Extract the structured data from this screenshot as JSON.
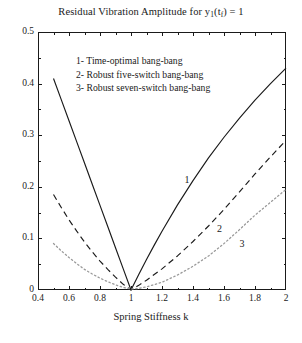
{
  "chart_data": {
    "type": "line",
    "title": "Residual Vibration Amplitude for y1(tf) = 1",
    "title_parts": {
      "lead": "Residual Vibration Amplitude for y",
      "sub1": "1",
      "mid": "(t",
      "sub2": "f",
      "tail": ") = 1"
    },
    "xlabel": "Spring Stiffness k",
    "ylabel": "",
    "xlim": [
      0.4,
      2.0
    ],
    "ylim": [
      0.0,
      0.5
    ],
    "xticks": [
      0.4,
      0.6,
      0.8,
      1.0,
      1.2,
      1.4,
      1.6,
      1.8,
      2.0
    ],
    "xtick_labels": [
      "0.4",
      "0.6",
      "0.8",
      "1",
      "1.2",
      "1.4",
      "1.6",
      "1.8",
      "2"
    ],
    "yticks": [
      0.0,
      0.1,
      0.2,
      0.3,
      0.4,
      0.5
    ],
    "ytick_labels": [
      "0",
      "0.1",
      "0.2",
      "0.3",
      "0.4",
      "0.5"
    ],
    "x_minor_ticks": [
      0.5,
      0.7,
      0.9,
      1.1,
      1.3,
      1.5,
      1.7,
      1.9
    ],
    "y_minor_ticks": [
      0.05,
      0.15,
      0.25,
      0.35,
      0.45
    ],
    "grid": false,
    "legend_position": "inside-top-center",
    "line_color": "#1a1a1a",
    "series": [
      {
        "name": "1- Time-optimal bang-bang",
        "tag": "1",
        "style": "solid",
        "x": [
          0.5,
          0.55,
          0.6,
          0.65,
          0.7,
          0.75,
          0.8,
          0.85,
          0.9,
          0.95,
          1.0,
          1.05,
          1.1,
          1.15,
          1.2,
          1.3,
          1.4,
          1.5,
          1.6,
          1.7,
          1.8,
          1.9,
          2.0
        ],
        "y": [
          0.41,
          0.369,
          0.328,
          0.287,
          0.246,
          0.205,
          0.164,
          0.123,
          0.082,
          0.041,
          0.0,
          0.03,
          0.059,
          0.087,
          0.114,
          0.165,
          0.212,
          0.256,
          0.296,
          0.333,
          0.368,
          0.4,
          0.43
        ]
      },
      {
        "name": "2- Robust five-switch bang-bang",
        "tag": "2",
        "style": "dashed",
        "x": [
          0.5,
          0.55,
          0.6,
          0.65,
          0.7,
          0.75,
          0.8,
          0.85,
          0.9,
          0.95,
          1.0,
          1.05,
          1.1,
          1.2,
          1.3,
          1.4,
          1.5,
          1.6,
          1.7,
          1.8,
          1.9,
          2.0
        ],
        "y": [
          0.185,
          0.16,
          0.136,
          0.114,
          0.093,
          0.074,
          0.056,
          0.04,
          0.025,
          0.011,
          0.0,
          0.009,
          0.019,
          0.041,
          0.066,
          0.094,
          0.124,
          0.156,
          0.19,
          0.225,
          0.258,
          0.29
        ]
      },
      {
        "name": "3- Robust seven-switch bang-bang",
        "tag": "3",
        "style": "dotted",
        "x": [
          0.5,
          0.55,
          0.6,
          0.65,
          0.7,
          0.75,
          0.8,
          0.85,
          0.9,
          0.95,
          1.0,
          1.05,
          1.1,
          1.2,
          1.3,
          1.4,
          1.5,
          1.6,
          1.7,
          1.8,
          1.9,
          2.0
        ],
        "y": [
          0.09,
          0.076,
          0.063,
          0.051,
          0.04,
          0.031,
          0.023,
          0.016,
          0.01,
          0.005,
          0.002,
          0.003,
          0.006,
          0.015,
          0.029,
          0.046,
          0.066,
          0.09,
          0.117,
          0.145,
          0.17,
          0.195
        ]
      }
    ],
    "curve_tags": [
      {
        "text": "1",
        "x": 1.345,
        "y": 0.222
      },
      {
        "text": "2",
        "x": 1.555,
        "y": 0.128
      },
      {
        "text": "3",
        "x": 1.7,
        "y": 0.099
      }
    ],
    "legend_entries": [
      "1- Time-optimal bang-bang",
      "2- Robust five-switch bang-bang",
      "3- Robust seven-switch bang-bang"
    ]
  }
}
